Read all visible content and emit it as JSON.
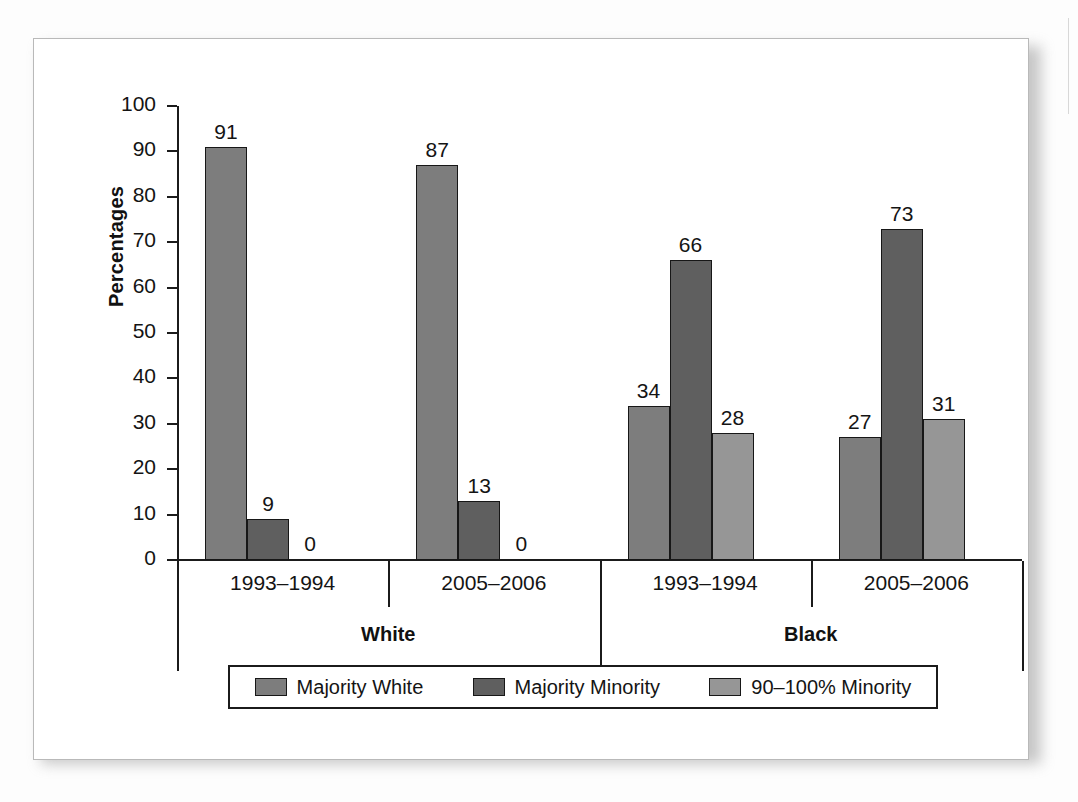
{
  "chart_data": {
    "type": "bar",
    "title": "",
    "xlabel": "",
    "ylabel": "Percentages",
    "ylim": [
      0,
      100
    ],
    "ytick_step": 10,
    "yticks": [
      100,
      90,
      80,
      70,
      60,
      50,
      40,
      30,
      20,
      10,
      0
    ],
    "grid": false,
    "legend_position": "bottom",
    "categories": [
      "1993–1994",
      "2005–2006",
      "1993–1994",
      "2005–2006"
    ],
    "group_labels": [
      "White",
      "Black"
    ],
    "groups": [
      {
        "name": "White",
        "periods": [
          {
            "label": "1993–1994",
            "values": [
              91,
              9,
              0
            ]
          },
          {
            "label": "2005–2006",
            "values": [
              87,
              13,
              0
            ]
          }
        ]
      },
      {
        "name": "Black",
        "periods": [
          {
            "label": "1993–1994",
            "values": [
              34,
              66,
              28
            ]
          },
          {
            "label": "2005–2006",
            "values": [
              27,
              73,
              31
            ]
          }
        ]
      }
    ],
    "series": [
      {
        "name": "Majority White",
        "color": "#7d7d7d",
        "values": [
          91,
          87,
          34,
          27
        ]
      },
      {
        "name": "Majority Minority",
        "color": "#5f5f5f",
        "values": [
          9,
          13,
          66,
          73
        ]
      },
      {
        "name": "90–100% Minority",
        "color": "#969696",
        "values": [
          0,
          0,
          28,
          31
        ]
      }
    ],
    "data_labels": [
      "91",
      "9",
      "0",
      "87",
      "13",
      "0",
      "34",
      "66",
      "28",
      "27",
      "73",
      "31"
    ]
  },
  "legend": {
    "items": [
      {
        "label": "Majority White",
        "color": "#7d7d7d"
      },
      {
        "label": "Majority Minority",
        "color": "#5f5f5f"
      },
      {
        "label": "90–100% Minority",
        "color": "#969696"
      }
    ]
  },
  "colors": {
    "axis": "#1b1b1b",
    "text": "#141414",
    "panel_background": "#ffffff",
    "panel_border": "#b9b9b9",
    "series_1": "#7d7d7d",
    "series_2": "#5f5f5f",
    "series_3": "#969696"
  }
}
